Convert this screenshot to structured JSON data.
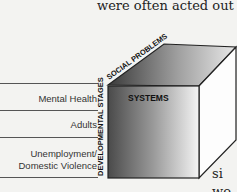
{
  "body_text": {
    "line1": "were often acted out",
    "fragment1": "si",
    "fragment2": "wo"
  },
  "table_labels": [
    {
      "text": "Mental Health"
    },
    {
      "text": "Adults"
    },
    {
      "text": "Unemployment/"
    },
    {
      "text": "Domestic Violence"
    }
  ],
  "cube": {
    "front_label": "SYSTEMS",
    "top_label": "SOCIAL PROBLEMS",
    "side_label": "DEVELOPMENTAL STAGES",
    "colors": {
      "front_dark": "#555555",
      "front_light": "#f5f5f5",
      "edge": "#222222",
      "side": "#ffffff"
    }
  }
}
